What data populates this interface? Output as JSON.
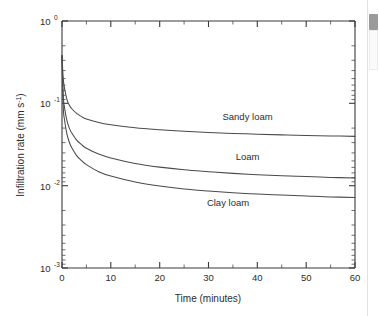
{
  "chart_data": {
    "type": "line",
    "title": "",
    "xlabel": "Time (minutes)",
    "ylabel": "Infiltration rate (mm s⁻¹)",
    "ylabel_main": "Infiltration rate (mm s",
    "ylabel_exp": "-1",
    "ylabel_tail": ")",
    "xlim": [
      0,
      60
    ],
    "ylim": [
      0.001,
      1
    ],
    "yscale": "log",
    "xscale": "linear",
    "grid": false,
    "legend_position": "inline-annotations",
    "x_ticks": [
      0,
      10,
      20,
      30,
      40,
      50,
      60
    ],
    "x_tick_labels": [
      "0",
      "10",
      "20",
      "30",
      "40",
      "50",
      "60"
    ],
    "x_minor_ticks": [
      5,
      15,
      25,
      35,
      45,
      55
    ],
    "y_ticks": [
      1,
      0.1,
      0.01,
      0.001
    ],
    "y_tick_labels": [
      "10",
      "10",
      "10",
      "10"
    ],
    "y_tick_exponents": [
      "0",
      "-1",
      "-2",
      "-3"
    ],
    "series": [
      {
        "name": "Sandy loam",
        "label": "Sandy loam",
        "x": [
          0,
          0.25,
          0.5,
          1,
          1.5,
          2,
          3,
          4,
          5,
          7.5,
          10,
          15,
          20,
          25,
          30,
          35,
          40,
          45,
          50,
          55,
          60
        ],
        "values": [
          0.38,
          0.2,
          0.155,
          0.112,
          0.095,
          0.086,
          0.0755,
          0.069,
          0.0645,
          0.0585,
          0.055,
          0.0505,
          0.0478,
          0.0458,
          0.0443,
          0.0431,
          0.0422,
          0.0414,
          0.0407,
          0.0402,
          0.0397
        ]
      },
      {
        "name": "Loam",
        "label": "Loam",
        "x": [
          0,
          0.25,
          0.5,
          1,
          1.5,
          2,
          3,
          4,
          5,
          7.5,
          10,
          15,
          20,
          25,
          30,
          35,
          40,
          45,
          50,
          55,
          60
        ],
        "values": [
          0.38,
          0.125,
          0.09,
          0.062,
          0.05,
          0.0435,
          0.0358,
          0.0315,
          0.0285,
          0.0242,
          0.0217,
          0.0186,
          0.0168,
          0.0156,
          0.0148,
          0.0141,
          0.0136,
          0.0132,
          0.0129,
          0.0126,
          0.0124
        ]
      },
      {
        "name": "Clay loam",
        "label": "Clay loam",
        "x": [
          0,
          0.25,
          0.5,
          1,
          1.5,
          2,
          3,
          4,
          5,
          7.5,
          10,
          15,
          20,
          25,
          30,
          35,
          40,
          45,
          50,
          55,
          60
        ],
        "values": [
          0.38,
          0.092,
          0.064,
          0.0425,
          0.0337,
          0.0288,
          0.0232,
          0.0201,
          0.018,
          0.0148,
          0.0131,
          0.0111,
          0.0099,
          0.0091,
          0.0086,
          0.0082,
          0.0079,
          0.0077,
          0.0075,
          0.0073,
          0.0072
        ]
      }
    ],
    "annotations": [
      {
        "text": "Sandy loam",
        "x": 38,
        "y": 0.062
      },
      {
        "text": "Loam",
        "x": 38,
        "y": 0.0205
      },
      {
        "text": "Clay loam",
        "x": 34,
        "y": 0.0057
      }
    ],
    "colors": {
      "curve": "#4a4a4a",
      "axis": "#3a3a3a",
      "text": "#2d2d2d",
      "background": "#ffffff"
    }
  },
  "scrollbar": {
    "present": true,
    "thumb_color": "#9a9a9a"
  }
}
